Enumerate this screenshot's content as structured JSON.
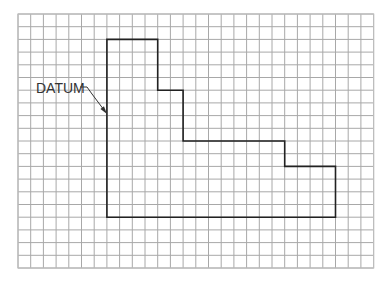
{
  "diagram": {
    "type": "grid-drawing",
    "grid": {
      "x0": 18,
      "y0": 14,
      "columns": 28,
      "rows": 20,
      "cell": 12.7,
      "line_color": "#a8a8a8",
      "border_color": "#bdbdbd"
    },
    "profile": {
      "stroke": "#222222",
      "stroke_width": 1.6,
      "points_grid": [
        [
          7,
          2
        ],
        [
          11,
          2
        ],
        [
          11,
          6
        ],
        [
          13,
          6
        ],
        [
          13,
          10
        ],
        [
          21,
          10
        ],
        [
          21,
          12
        ],
        [
          25,
          12
        ],
        [
          25,
          16
        ],
        [
          7,
          16
        ]
      ]
    },
    "datum": {
      "label": "DATUM",
      "label_x": 36,
      "label_y": 81,
      "leader_points": [
        [
          80,
          87
        ],
        [
          87,
          87
        ],
        [
          92,
          94
        ],
        [
          104,
          110
        ]
      ],
      "arrow_tip": [
        107,
        114
      ],
      "color": "#333333"
    }
  }
}
